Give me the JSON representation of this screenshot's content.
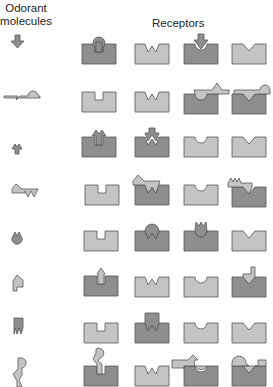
{
  "headers": {
    "odorant": "Odorant molecules",
    "receptors": "Receptors"
  },
  "colors": {
    "dark_fill": "#8e8e8e",
    "light_fill": "#c4c4c4",
    "stroke": "#555555"
  },
  "receptor_site_types": [
    "square-notch",
    "w-notch",
    "round-notch",
    "v-notch"
  ],
  "rows": [
    {
      "odorant": "down-arrow-round-tip",
      "bound": [
        true,
        false,
        true,
        false
      ]
    },
    {
      "odorant": "wave-round-v",
      "bound": [
        false,
        false,
        true,
        true
      ]
    },
    {
      "odorant": "arrow-w",
      "bound": [
        true,
        true,
        false,
        false
      ]
    },
    {
      "odorant": "triangle-w",
      "bound": [
        false,
        true,
        false,
        true
      ]
    },
    {
      "odorant": "round-w",
      "bound": [
        false,
        true,
        true,
        false
      ]
    },
    {
      "odorant": "arrow-up-square",
      "bound": [
        true,
        false,
        false,
        true
      ]
    },
    {
      "odorant": "square-w",
      "bound": [
        false,
        true,
        false,
        false
      ]
    },
    {
      "odorant": "round-square-v",
      "bound": [
        true,
        false,
        true,
        true
      ]
    }
  ]
}
